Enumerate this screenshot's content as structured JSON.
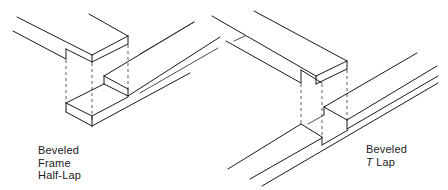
{
  "diagram": {
    "type": "isometric woodworking joint illustration",
    "joints": [
      {
        "id": "frame-half-lap",
        "label_lines": [
          "Beveled",
          "Frame",
          "Half-Lap"
        ]
      },
      {
        "id": "t-lap",
        "label_prefix": "T",
        "label_lines": [
          "Beveled",
          "Lap"
        ]
      }
    ],
    "colors": {
      "line": "#1a1a1a",
      "background": "#ffffff"
    }
  }
}
